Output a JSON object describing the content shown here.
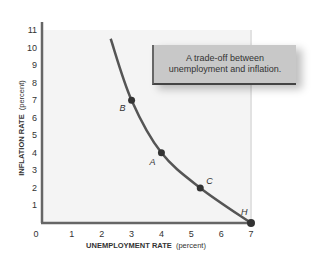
{
  "chart_data": {
    "type": "line",
    "title": "",
    "xlabel": "UNEMPLOYMENT RATE (percent)",
    "xlabel_bold": "UNEMPLOYMENT RATE",
    "xlabel_unit": "(percent)",
    "ylabel": "INFLATION RATE (percent)",
    "ylabel_bold": "INFLATION RATE",
    "ylabel_unit": "(percent)",
    "xlim": [
      0,
      7
    ],
    "ylim": [
      0,
      11
    ],
    "x_ticks": [
      "0",
      "1",
      "2",
      "3",
      "4",
      "5",
      "6",
      "7"
    ],
    "y_ticks": [
      "1",
      "2",
      "3",
      "4",
      "5",
      "6",
      "7",
      "8",
      "9",
      "10",
      "11"
    ],
    "grid": false,
    "series": [
      {
        "name": "Phillips curve",
        "color": "#555555",
        "x": [
          2.3,
          3.0,
          4.0,
          5.3,
          7.0
        ],
        "y": [
          10.5,
          7.0,
          4.0,
          2.0,
          0.0
        ]
      }
    ],
    "points": [
      {
        "label": "B",
        "x": 3.0,
        "y": 7.0
      },
      {
        "label": "A",
        "x": 4.0,
        "y": 4.0
      },
      {
        "label": "C",
        "x": 5.3,
        "y": 2.0
      },
      {
        "label": "H",
        "x": 7.0,
        "y": 0.0
      }
    ],
    "annotations": [
      {
        "text_line1": "A trade-off between",
        "text_line2": "unemployment and inflation."
      }
    ]
  }
}
